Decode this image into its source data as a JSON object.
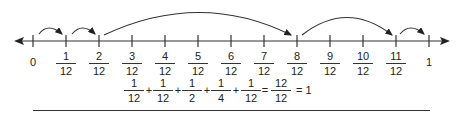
{
  "diagram": {
    "type": "number-line",
    "range": {
      "min": 0,
      "max": 1
    },
    "denominator": 12,
    "start_label": "0",
    "end_label": "1",
    "tick_labels": [
      {
        "num": "1",
        "den": "12"
      },
      {
        "num": "2",
        "den": "12"
      },
      {
        "num": "3",
        "den": "12"
      },
      {
        "num": "4",
        "den": "12"
      },
      {
        "num": "5",
        "den": "12"
      },
      {
        "num": "6",
        "den": "12"
      },
      {
        "num": "7",
        "den": "12"
      },
      {
        "num": "8",
        "den": "12"
      },
      {
        "num": "9",
        "den": "12"
      },
      {
        "num": "10",
        "den": "12"
      },
      {
        "num": "11",
        "den": "12"
      }
    ],
    "jumps": [
      {
        "from": "0",
        "to": "1/12",
        "size": "1/12"
      },
      {
        "from": "1/12",
        "to": "2/12",
        "size": "1/12"
      },
      {
        "from": "2/12",
        "to": "8/12",
        "size": "1/2"
      },
      {
        "from": "8/12",
        "to": "11/12",
        "size": "1/4"
      },
      {
        "from": "11/12",
        "to": "1",
        "size": "1/12"
      }
    ],
    "line_color": "#333333"
  },
  "equation": {
    "terms": [
      {
        "num": "1",
        "den": "12"
      },
      {
        "num": "1",
        "den": "12"
      },
      {
        "num": "1",
        "den": "2"
      },
      {
        "num": "1",
        "den": "4"
      },
      {
        "num": "1",
        "den": "12"
      }
    ],
    "plus": "+",
    "equals": "=",
    "result": {
      "num": "12",
      "den": "12"
    },
    "tail": "= 1"
  }
}
